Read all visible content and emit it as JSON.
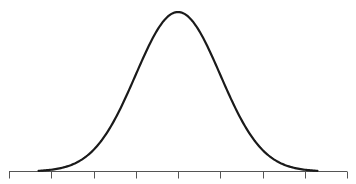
{
  "chart_data": {
    "type": "line",
    "title": "",
    "xlabel": "",
    "ylabel": "",
    "x_ticks": [
      -4,
      -3,
      -2,
      -1,
      0,
      1,
      2,
      3,
      4
    ],
    "tick_labels": [
      "",
      "",
      "",
      "",
      "",
      "",
      "",
      "",
      ""
    ],
    "xlim": [
      -4,
      4
    ],
    "curve_range": [
      -3.3,
      3.3
    ],
    "mean": 0,
    "sd": 1,
    "series": [
      {
        "name": "normal-density",
        "x": [
          -3.3,
          -3,
          -2.5,
          -2,
          -1.5,
          -1,
          -0.5,
          0,
          0.5,
          1,
          1.5,
          2,
          2.5,
          3,
          3.3
        ],
        "y": [
          0.0017,
          0.0044,
          0.0175,
          0.054,
          0.1295,
          0.242,
          0.3521,
          0.3989,
          0.3521,
          0.242,
          0.1295,
          0.054,
          0.0175,
          0.0044,
          0.0017
        ]
      }
    ],
    "grid": false,
    "legend": "none",
    "colors": {
      "curve": "#1a1a1a",
      "axis": "#555555"
    }
  }
}
